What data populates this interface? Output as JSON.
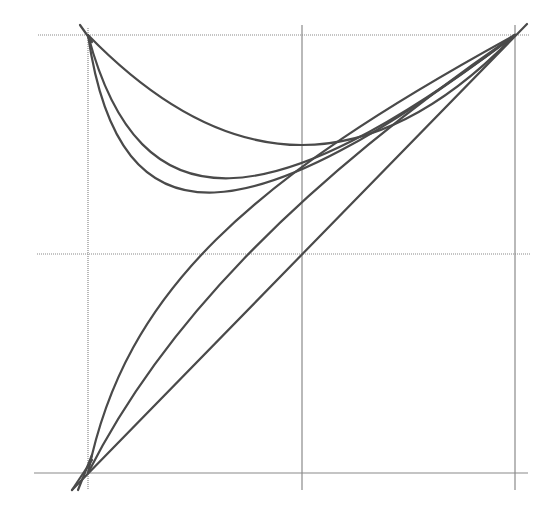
{
  "diagram": {
    "type": "curve-family",
    "colors": {
      "background": "#ffffff",
      "grid": "#8a8a8a",
      "curve": "#4a4a4a"
    },
    "grid": {
      "x_lines_px": [
        88,
        302,
        515
      ],
      "y_lines_px": [
        35,
        254,
        473
      ],
      "normalized": {
        "x": [
          0,
          0.5,
          1
        ],
        "y": [
          1,
          0.5,
          0
        ]
      }
    },
    "curves": [
      {
        "id": "upper-shallow",
        "from": [
          0,
          1
        ],
        "to": [
          1,
          1
        ],
        "min_y": 0.75,
        "path": "M88 35 Q302 255 515 35"
      },
      {
        "id": "upper-mid",
        "from": [
          0,
          1
        ],
        "to": [
          1,
          1
        ],
        "min_y": 0.67,
        "path": "M88 35 C140 232, 270 220, 515 35"
      },
      {
        "id": "upper-deep",
        "from": [
          0,
          1
        ],
        "to": [
          1,
          1
        ],
        "min_y": 0.64,
        "path": "M88 35 C120 255, 250 235, 515 35"
      },
      {
        "id": "lower-strong",
        "from": [
          0,
          0
        ],
        "to": [
          1,
          1
        ],
        "path": "M88 473 C125 290, 250 180, 515 35"
      },
      {
        "id": "lower-mild",
        "from": [
          0,
          0
        ],
        "to": [
          1,
          1
        ],
        "path": "M88 473 C160 330, 290 190, 515 35"
      },
      {
        "id": "diagonal",
        "from": [
          0,
          0
        ],
        "to": [
          1,
          1
        ],
        "path": "M72 490 L527 24"
      }
    ],
    "overshoot_paths": [
      "M80 25 L92 42",
      "M72 490 L92 460",
      "M78 490 L92 455"
    ]
  }
}
